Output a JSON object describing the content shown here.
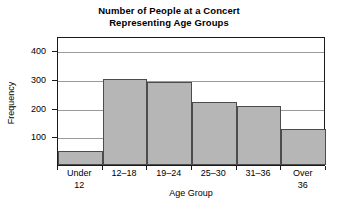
{
  "chart_data": {
    "type": "bar",
    "title": "Number of People at a Concert Representing Age Groups",
    "title_lines": [
      "Number of People at a Concert",
      "Representing Age Groups"
    ],
    "categories": [
      "Under 12",
      "12–18",
      "19–24",
      "25–30",
      "31–36",
      "Over 36"
    ],
    "category_lines": [
      [
        "Under",
        "12"
      ],
      [
        "12–18",
        ""
      ],
      [
        "19–24",
        ""
      ],
      [
        "25–30",
        ""
      ],
      [
        "31–36",
        ""
      ],
      [
        "Over",
        "36"
      ]
    ],
    "values": [
      50,
      300,
      290,
      220,
      205,
      125
    ],
    "xlabel": "Age Group",
    "ylabel": "Frequency",
    "ylim": [
      0,
      450
    ],
    "yticks": [
      100,
      200,
      300,
      400
    ],
    "ytick_labels": [
      "100",
      "200",
      "300",
      "400"
    ],
    "grid": true,
    "legend": "none",
    "bar_fill_color": "#b6b6b6",
    "bar_border_color": "#4c4c4c",
    "axis_color": "#1a1a1a",
    "gridline_color": "#9a9a9a",
    "background_color": "#ffffff"
  }
}
